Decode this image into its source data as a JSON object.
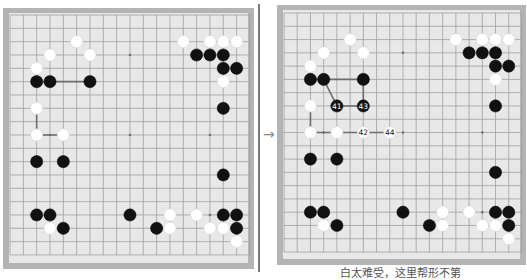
{
  "board_size": 19,
  "colors": {
    "frame": "#b4b4b4",
    "board": "#e8e8e8",
    "grid_line": "#a0a0a0",
    "star_point": "#707070",
    "black_stone": "#111111",
    "white_stone": "#ffffff",
    "connector": "#6e6e6e",
    "divider": "#7a7a7a"
  },
  "arrow": "→",
  "left_board": {
    "caption": "",
    "stones": [
      {
        "c": "W",
        "x": 5,
        "y": 2
      },
      {
        "c": "W",
        "x": 3,
        "y": 3
      },
      {
        "c": "W",
        "x": 6,
        "y": 3
      },
      {
        "c": "W",
        "x": 2,
        "y": 4
      },
      {
        "c": "B",
        "x": 2,
        "y": 5
      },
      {
        "c": "B",
        "x": 3,
        "y": 5
      },
      {
        "c": "B",
        "x": 6,
        "y": 5
      },
      {
        "c": "W",
        "x": 2,
        "y": 7
      },
      {
        "c": "W",
        "x": 2,
        "y": 9
      },
      {
        "c": "W",
        "x": 4,
        "y": 9
      },
      {
        "c": "B",
        "x": 2,
        "y": 11
      },
      {
        "c": "B",
        "x": 4,
        "y": 11
      },
      {
        "c": "B",
        "x": 2,
        "y": 15
      },
      {
        "c": "B",
        "x": 3,
        "y": 15
      },
      {
        "c": "W",
        "x": 3,
        "y": 16
      },
      {
        "c": "B",
        "x": 4,
        "y": 16
      },
      {
        "c": "B",
        "x": 9,
        "y": 15
      },
      {
        "c": "W",
        "x": 12,
        "y": 15
      },
      {
        "c": "B",
        "x": 11,
        "y": 16
      },
      {
        "c": "W",
        "x": 12,
        "y": 16
      },
      {
        "c": "W",
        "x": 14,
        "y": 15
      },
      {
        "c": "B",
        "x": 16,
        "y": 15
      },
      {
        "c": "B",
        "x": 17,
        "y": 15
      },
      {
        "c": "W",
        "x": 15,
        "y": 16
      },
      {
        "c": "W",
        "x": 16,
        "y": 16
      },
      {
        "c": "B",
        "x": 17,
        "y": 16
      },
      {
        "c": "W",
        "x": 17,
        "y": 17
      },
      {
        "c": "W",
        "x": 13,
        "y": 2
      },
      {
        "c": "W",
        "x": 15,
        "y": 2
      },
      {
        "c": "W",
        "x": 16,
        "y": 2
      },
      {
        "c": "W",
        "x": 17,
        "y": 2
      },
      {
        "c": "B",
        "x": 14,
        "y": 3
      },
      {
        "c": "B",
        "x": 15,
        "y": 3
      },
      {
        "c": "B",
        "x": 16,
        "y": 3
      },
      {
        "c": "B",
        "x": 16,
        "y": 4
      },
      {
        "c": "B",
        "x": 17,
        "y": 4
      },
      {
        "c": "W",
        "x": 16,
        "y": 5
      },
      {
        "c": "B",
        "x": 16,
        "y": 7
      },
      {
        "c": "B",
        "x": 16,
        "y": 12
      }
    ],
    "lines": [
      {
        "from": [
          2,
          5
        ],
        "to": [
          6,
          5
        ]
      },
      {
        "from": [
          2,
          7
        ],
        "to": [
          2,
          9
        ]
      },
      {
        "from": [
          2,
          9
        ],
        "to": [
          4,
          9
        ]
      }
    ]
  },
  "right_board": {
    "caption": "白太难受，这里帮形不第",
    "stones": [
      {
        "c": "W",
        "x": 5,
        "y": 2
      },
      {
        "c": "W",
        "x": 3,
        "y": 3
      },
      {
        "c": "W",
        "x": 6,
        "y": 3
      },
      {
        "c": "W",
        "x": 2,
        "y": 4
      },
      {
        "c": "B",
        "x": 2,
        "y": 5
      },
      {
        "c": "B",
        "x": 3,
        "y": 5
      },
      {
        "c": "B",
        "x": 6,
        "y": 5
      },
      {
        "c": "W",
        "x": 2,
        "y": 7
      },
      {
        "c": "W",
        "x": 2,
        "y": 9
      },
      {
        "c": "W",
        "x": 4,
        "y": 9
      },
      {
        "c": "B",
        "x": 4,
        "y": 7,
        "n": "41"
      },
      {
        "c": "W",
        "x": 6,
        "y": 9,
        "n": "42"
      },
      {
        "c": "B",
        "x": 6,
        "y": 7,
        "n": "43"
      },
      {
        "c": "W",
        "x": 8,
        "y": 9,
        "n": "44"
      },
      {
        "c": "B",
        "x": 2,
        "y": 11
      },
      {
        "c": "B",
        "x": 4,
        "y": 11
      },
      {
        "c": "B",
        "x": 2,
        "y": 15
      },
      {
        "c": "B",
        "x": 3,
        "y": 15
      },
      {
        "c": "W",
        "x": 3,
        "y": 16
      },
      {
        "c": "B",
        "x": 4,
        "y": 16
      },
      {
        "c": "B",
        "x": 9,
        "y": 15
      },
      {
        "c": "W",
        "x": 12,
        "y": 15
      },
      {
        "c": "B",
        "x": 11,
        "y": 16
      },
      {
        "c": "W",
        "x": 12,
        "y": 16
      },
      {
        "c": "W",
        "x": 14,
        "y": 15
      },
      {
        "c": "B",
        "x": 16,
        "y": 15
      },
      {
        "c": "B",
        "x": 17,
        "y": 15
      },
      {
        "c": "W",
        "x": 15,
        "y": 16
      },
      {
        "c": "W",
        "x": 16,
        "y": 16
      },
      {
        "c": "B",
        "x": 17,
        "y": 16
      },
      {
        "c": "W",
        "x": 17,
        "y": 17
      },
      {
        "c": "W",
        "x": 13,
        "y": 2
      },
      {
        "c": "W",
        "x": 15,
        "y": 2
      },
      {
        "c": "W",
        "x": 16,
        "y": 2
      },
      {
        "c": "W",
        "x": 17,
        "y": 2
      },
      {
        "c": "B",
        "x": 14,
        "y": 3
      },
      {
        "c": "B",
        "x": 15,
        "y": 3
      },
      {
        "c": "B",
        "x": 16,
        "y": 3
      },
      {
        "c": "B",
        "x": 16,
        "y": 4
      },
      {
        "c": "B",
        "x": 17,
        "y": 4
      },
      {
        "c": "W",
        "x": 16,
        "y": 5
      },
      {
        "c": "B",
        "x": 16,
        "y": 7
      },
      {
        "c": "B",
        "x": 16,
        "y": 12
      }
    ],
    "lines": [
      {
        "from": [
          2,
          5
        ],
        "to": [
          6,
          5
        ]
      },
      {
        "from": [
          3,
          5
        ],
        "to": [
          4,
          7
        ]
      },
      {
        "from": [
          4,
          7
        ],
        "to": [
          6,
          7
        ]
      },
      {
        "from": [
          6,
          5
        ],
        "to": [
          6,
          7
        ]
      },
      {
        "from": [
          2,
          7
        ],
        "to": [
          2,
          9
        ]
      },
      {
        "from": [
          2,
          9
        ],
        "to": [
          8,
          9
        ]
      }
    ]
  }
}
